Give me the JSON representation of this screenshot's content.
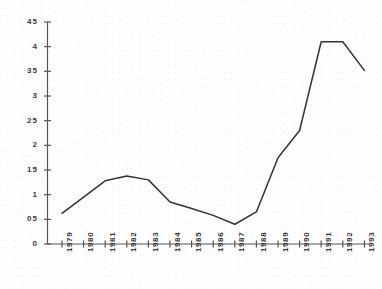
{
  "chart_data": {
    "type": "line",
    "title": "",
    "subtitle": "",
    "xlabel": "",
    "ylabel": "",
    "categories": [
      "1979",
      "1980",
      "1981",
      "1982",
      "1983",
      "1984",
      "1985",
      "1986",
      "1987",
      "1988",
      "1989",
      "1990",
      "1991",
      "1992",
      "1993"
    ],
    "values": [
      0.62,
      0.95,
      1.28,
      1.38,
      1.3,
      0.85,
      0.72,
      0.58,
      0.4,
      0.65,
      1.75,
      2.3,
      4.1,
      4.1,
      3.52
    ],
    "series": [
      {
        "name": "series-1",
        "values": [
          0.62,
          0.95,
          1.28,
          1.38,
          1.3,
          0.85,
          0.72,
          0.58,
          0.4,
          0.65,
          1.75,
          2.3,
          4.1,
          4.1,
          3.52
        ]
      }
    ],
    "ylim": [
      0,
      4.5
    ],
    "ytick_values": [
      0,
      0.5,
      1,
      1.5,
      2,
      2.5,
      3,
      3.5,
      4,
      4.5
    ],
    "ytick_labels": [
      "0",
      "05",
      "1",
      "15",
      "2",
      "25",
      "3",
      "35",
      "4",
      "45"
    ],
    "xtick_labels": [
      "1979",
      "1980",
      "1981",
      "1982",
      "1983",
      "1984",
      "1985",
      "1986",
      "1987",
      "1988",
      "1989",
      "1990",
      "1991",
      "1992",
      "1993"
    ],
    "grid": false,
    "legend": false,
    "legend_position": "none",
    "line_color": "#333333",
    "axis_color": "#555555",
    "background_color": "#ffffff",
    "xtick_label_rotation": -90,
    "annotations": []
  }
}
